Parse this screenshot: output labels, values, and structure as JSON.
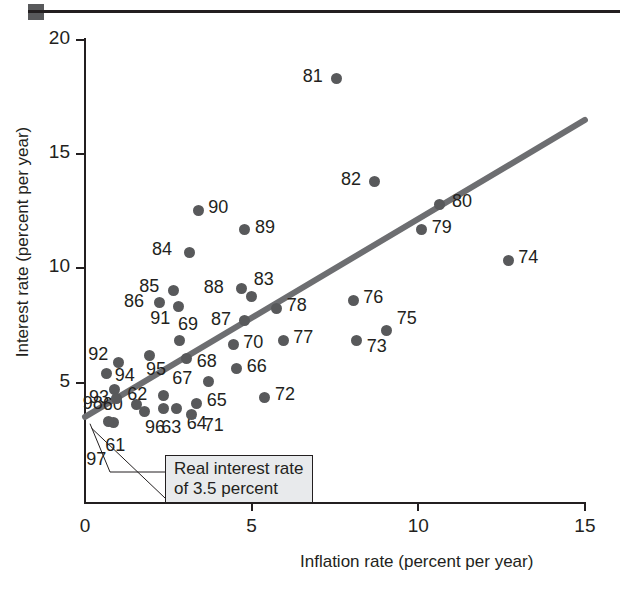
{
  "chart_data": {
    "type": "scatter",
    "title": "",
    "xlabel": "Inflation rate (percent per year)",
    "ylabel": "Interest rate (percent per year)",
    "xlim": [
      0,
      15.8
    ],
    "ylim": [
      0,
      20.8
    ],
    "xticks": [
      0,
      5,
      10,
      15
    ],
    "yticks": [
      5,
      10,
      15,
      20
    ],
    "grid": false,
    "legend": null,
    "annotations": [
      {
        "text_line1": "Real interest rate",
        "text_line2": "of 3.5 percent"
      }
    ],
    "trendline": {
      "x0": 0.0,
      "y0": 3.5,
      "x1": 15.0,
      "y1": 16.5,
      "color": "#6d6e71"
    },
    "point_color": "#58595b",
    "points": [
      {
        "label": "60",
        "x": 1.55,
        "y": 4.05,
        "lx": -34,
        "ly": -6
      },
      {
        "label": "61",
        "x": 0.85,
        "y": 3.25,
        "lx": -8,
        "ly": 16
      },
      {
        "label": "62",
        "x": 2.35,
        "y": 4.45,
        "lx": -36,
        "ly": -7
      },
      {
        "label": "63",
        "x": 2.35,
        "y": 3.85,
        "lx": -2,
        "ly": 12
      },
      {
        "label": "64",
        "x": 2.75,
        "y": 3.85,
        "lx": 10,
        "ly": 8
      },
      {
        "label": "65",
        "x": 3.35,
        "y": 4.1,
        "lx": 10,
        "ly": -9
      },
      {
        "label": "66",
        "x": 4.55,
        "y": 5.6,
        "lx": 10,
        "ly": -9
      },
      {
        "label": "67",
        "x": 3.7,
        "y": 5.05,
        "lx": -36,
        "ly": -9
      },
      {
        "label": "68",
        "x": 3.05,
        "y": 6.05,
        "lx": 10,
        "ly": -4
      },
      {
        "label": "69",
        "x": 2.85,
        "y": 6.85,
        "lx": -2,
        "ly": -22
      },
      {
        "label": "70",
        "x": 4.45,
        "y": 6.65,
        "lx": 10,
        "ly": -9
      },
      {
        "label": "71",
        "x": 3.2,
        "y": 3.6,
        "lx": 12,
        "ly": 4
      },
      {
        "label": "72",
        "x": 5.4,
        "y": 4.35,
        "lx": 10,
        "ly": -9
      },
      {
        "label": "73",
        "x": 8.15,
        "y": 6.85,
        "lx": 10,
        "ly": 0
      },
      {
        "label": "74",
        "x": 12.7,
        "y": 10.35,
        "lx": 10,
        "ly": -9
      },
      {
        "label": "75",
        "x": 9.05,
        "y": 7.3,
        "lx": 10,
        "ly": -18
      },
      {
        "label": "76",
        "x": 8.05,
        "y": 8.6,
        "lx": 10,
        "ly": -9
      },
      {
        "label": "77",
        "x": 5.95,
        "y": 6.85,
        "lx": 10,
        "ly": -9
      },
      {
        "label": "78",
        "x": 5.75,
        "y": 8.25,
        "lx": 10,
        "ly": -9
      },
      {
        "label": "79",
        "x": 10.1,
        "y": 11.7,
        "lx": 10,
        "ly": -9
      },
      {
        "label": "80",
        "x": 10.65,
        "y": 12.8,
        "lx": 12,
        "ly": -9
      },
      {
        "label": "81",
        "x": 7.55,
        "y": 18.3,
        "lx": -34,
        "ly": -9
      },
      {
        "label": "82",
        "x": 8.7,
        "y": 13.8,
        "lx": -34,
        "ly": -9
      },
      {
        "label": "83",
        "x": 5.0,
        "y": 8.75,
        "lx": 2,
        "ly": -24
      },
      {
        "label": "84",
        "x": 3.15,
        "y": 10.7,
        "lx": -38,
        "ly": -9
      },
      {
        "label": "85",
        "x": 2.65,
        "y": 9.05,
        "lx": -34,
        "ly": -10
      },
      {
        "label": "86",
        "x": 2.25,
        "y": 8.5,
        "lx": -36,
        "ly": -8
      },
      {
        "label": "87",
        "x": 4.8,
        "y": 7.7,
        "lx": -34,
        "ly": -8
      },
      {
        "label": "88",
        "x": 4.7,
        "y": 9.1,
        "lx": -38,
        "ly": -8
      },
      {
        "label": "89",
        "x": 4.8,
        "y": 11.7,
        "lx": 10,
        "ly": -9
      },
      {
        "label": "90",
        "x": 3.4,
        "y": 12.55,
        "lx": 10,
        "ly": -9
      },
      {
        "label": "91",
        "x": 2.8,
        "y": 8.35,
        "lx": -28,
        "ly": 6
      },
      {
        "label": "92",
        "x": 1.0,
        "y": 5.9,
        "lx": -30,
        "ly": -14
      },
      {
        "label": "93",
        "x": 0.9,
        "y": 4.7,
        "lx": -26,
        "ly": 2
      },
      {
        "label": "94",
        "x": 0.65,
        "y": 5.4,
        "lx": 8,
        "ly": -4
      },
      {
        "label": "95",
        "x": 1.95,
        "y": 6.2,
        "lx": -4,
        "ly": 8
      },
      {
        "label": "96",
        "x": 1.8,
        "y": 3.75,
        "lx": 0,
        "ly": 10
      },
      {
        "label": "97",
        "x": 0.7,
        "y": 3.3,
        "lx": -22,
        "ly": 32
      },
      {
        "label": "98",
        "x": 0.95,
        "y": 4.3,
        "lx": -34,
        "ly": -2
      }
    ]
  },
  "axes": {
    "x_title": "Inflation rate (percent per year)",
    "y_title": "Interest rate (percent per year)",
    "x_tick_labels": [
      "0",
      "5",
      "10",
      "15"
    ],
    "y_tick_labels": [
      "5",
      "10",
      "15",
      "20"
    ]
  },
  "callout": {
    "line1": "Real interest rate",
    "line2": "of 3.5 percent"
  }
}
